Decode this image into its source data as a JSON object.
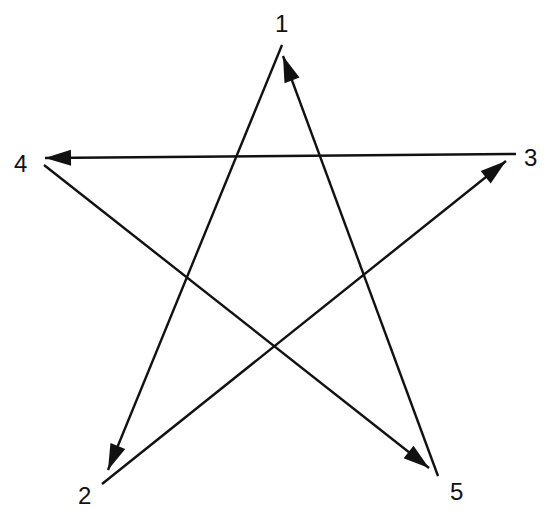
{
  "diagram": {
    "title": "",
    "type": "pentagram-arrow-sequence",
    "colors": {
      "stroke": "#111111",
      "background": "#ffffff"
    },
    "nodes": [
      {
        "id": "1",
        "label": "1",
        "x": 282,
        "y": 22
      },
      {
        "id": "2",
        "label": "2",
        "x": 86,
        "y": 494
      },
      {
        "id": "3",
        "label": "3",
        "x": 530,
        "y": 157
      },
      {
        "id": "4",
        "label": "4",
        "x": 22,
        "y": 163
      },
      {
        "id": "5",
        "label": "5",
        "x": 458,
        "y": 490
      }
    ],
    "edges": [
      {
        "from": "1",
        "to": "2",
        "x1": 282,
        "y1": 45,
        "x2": 108,
        "y2": 470
      },
      {
        "from": "2",
        "to": "3",
        "x1": 102,
        "y1": 484,
        "x2": 506,
        "y2": 161
      },
      {
        "from": "3",
        "to": "4",
        "x1": 516,
        "y1": 154,
        "x2": 45,
        "y2": 158
      },
      {
        "from": "4",
        "to": "5",
        "x1": 44,
        "y1": 165,
        "x2": 429,
        "y2": 468
      },
      {
        "from": "5",
        "to": "1",
        "x1": 438,
        "y1": 476,
        "x2": 283,
        "y2": 56
      }
    ]
  }
}
